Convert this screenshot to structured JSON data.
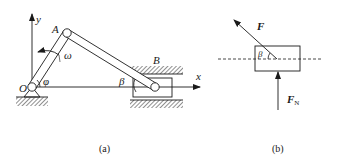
{
  "figure": {
    "panel_a": {
      "caption": "(a)",
      "labels": {
        "origin": "O",
        "y_axis": "y",
        "x_axis": "x",
        "joint_a": "A",
        "joint_b": "B",
        "angular_velocity": "ω",
        "angle_phi": "φ",
        "angle_beta": "β"
      }
    },
    "panel_b": {
      "caption": "(b)",
      "labels": {
        "force": "F",
        "normal_force_main": "F",
        "normal_force_sub": "N",
        "angle_beta": "β"
      }
    }
  },
  "colors": {
    "ink": "#1a1a1a",
    "hatch": "#555555",
    "background": "#ffffff"
  }
}
